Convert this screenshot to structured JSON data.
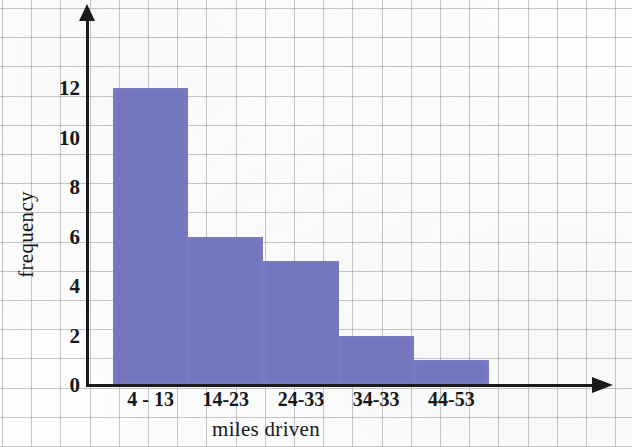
{
  "chart_data": {
    "type": "bar",
    "title": "",
    "subtitle": "",
    "xlabel": "miles driven",
    "ylabel": "frequency",
    "categories": [
      "4 - 13",
      "14-23",
      "24-33",
      "34-33",
      "44-53"
    ],
    "values": [
      12,
      6,
      5,
      2,
      1
    ],
    "series": [
      {
        "name": "frequency",
        "values": [
          12,
          6,
          5,
          2,
          1
        ]
      }
    ],
    "ylim": [
      0,
      13
    ],
    "xlim": [
      0,
      5
    ],
    "y_ticks": [
      "0",
      "2",
      "4",
      "6",
      "8",
      "10",
      "12"
    ],
    "y_tick_values": [
      0,
      2,
      4,
      6,
      8,
      10,
      12
    ],
    "grid": true,
    "grid_style": "graph-paper",
    "legend": "none",
    "bar_color": "#7375be",
    "axis_color": "#1a1a1a",
    "grid_color": "#96989e",
    "background_color": "#fdfdfd",
    "annotations": []
  },
  "axes": {
    "y_axis_arrow": "arrow-up-icon",
    "x_axis_arrow": "arrow-right-icon"
  }
}
